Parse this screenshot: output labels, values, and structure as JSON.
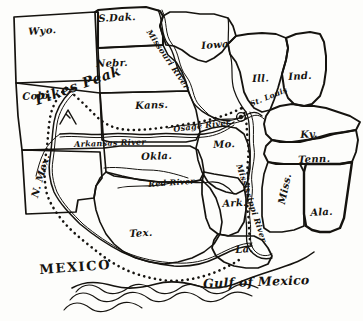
{
  "map": {
    "title": "Louisiana Purchase territory map",
    "background_color": "#fdfdfb",
    "ink_color": "#15130f",
    "style": "hand-drawn pen and ink sketch map"
  },
  "states": [
    {
      "name": "wyoming",
      "label": "Wyo.",
      "x": 28,
      "y": 27,
      "rotate": -4
    },
    {
      "name": "south-dakota",
      "label": "S.Dak.",
      "x": 98,
      "y": 14,
      "rotate": -3
    },
    {
      "name": "nebraska",
      "label": "Nebr.",
      "x": 96,
      "y": 59,
      "rotate": -2
    },
    {
      "name": "iowa",
      "label": "Iowa",
      "x": 201,
      "y": 41,
      "rotate": -4
    },
    {
      "name": "illinois",
      "label": "Ill.",
      "x": 252,
      "y": 74,
      "rotate": -2
    },
    {
      "name": "indiana",
      "label": "Ind.",
      "x": 288,
      "y": 72,
      "rotate": -3
    },
    {
      "name": "colorado",
      "label": "Colo.",
      "x": 22,
      "y": 92,
      "rotate": -3
    },
    {
      "name": "kansas",
      "label": "Kans.",
      "x": 135,
      "y": 101,
      "rotate": -2
    },
    {
      "name": "missouri",
      "label": "Mo.",
      "x": 213,
      "y": 140,
      "rotate": -2
    },
    {
      "name": "kentucky",
      "label": "Ky.",
      "x": 300,
      "y": 130,
      "rotate": -3
    },
    {
      "name": "tennessee",
      "label": "Tenn.",
      "x": 298,
      "y": 155,
      "rotate": -2
    },
    {
      "name": "oklahoma",
      "label": "Okla.",
      "x": 141,
      "y": 152,
      "rotate": -2
    },
    {
      "name": "new-mexico",
      "label": "N. Mex.",
      "x": 30,
      "y": 196,
      "rotate": -74
    },
    {
      "name": "texas",
      "label": "Tex.",
      "x": 129,
      "y": 229,
      "rotate": -3
    },
    {
      "name": "arkansas",
      "label": "Ark.",
      "x": 222,
      "y": 199,
      "rotate": -3
    },
    {
      "name": "mississippi",
      "label": "Miss.",
      "x": 277,
      "y": 203,
      "rotate": -78
    },
    {
      "name": "alabama",
      "label": "Ala.",
      "x": 310,
      "y": 208,
      "rotate": -3
    },
    {
      "name": "louisiana",
      "label": "La.",
      "x": 235,
      "y": 245,
      "rotate": -3
    }
  ],
  "rivers": [
    {
      "name": "missouri-river",
      "label": "Missouri River",
      "x": 152,
      "y": 28,
      "rotate": 56
    },
    {
      "name": "arkansas-river",
      "label": "Arkansas River",
      "x": 74,
      "y": 140,
      "rotate": -2
    },
    {
      "name": "osage-river",
      "label": "Osage River",
      "x": 173,
      "y": 125,
      "rotate": -7
    },
    {
      "name": "red-river",
      "label": "Red River",
      "x": 148,
      "y": 180,
      "rotate": -4
    },
    {
      "name": "mississippi-river",
      "label": "Mississippi River",
      "x": 243,
      "y": 163,
      "rotate": 72
    }
  ],
  "cities": [
    {
      "name": "st-louis",
      "label": "St. Louis",
      "x": 249,
      "y": 101,
      "rotate": -22,
      "marker_x": 241,
      "marker_y": 117
    }
  ],
  "landmarks": [
    {
      "name": "pikes-peak",
      "label": "Pikes Peak",
      "x": 33,
      "y": 94,
      "rotate": -20
    }
  ],
  "regions": [
    {
      "name": "mexico",
      "label": "MEXICO",
      "x": 39,
      "y": 263,
      "rotate": -4
    },
    {
      "name": "gulf-of-mexico",
      "label": "Gulf of Mexico",
      "x": 203,
      "y": 278,
      "rotate": -2
    }
  ]
}
